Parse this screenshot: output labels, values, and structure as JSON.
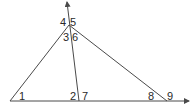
{
  "diagram": {
    "stroke_color": "#4a4a4a",
    "label_color": "#2a2a2a",
    "angle_labels": [
      {
        "id": "1",
        "text": "1",
        "x": 19,
        "y": 100
      },
      {
        "id": "2",
        "text": "2",
        "x": 70,
        "y": 100
      },
      {
        "id": "7",
        "text": "7",
        "x": 82,
        "y": 100
      },
      {
        "id": "3",
        "text": "3",
        "x": 63,
        "y": 41
      },
      {
        "id": "6",
        "text": "6",
        "x": 72,
        "y": 41
      },
      {
        "id": "4",
        "text": "4",
        "x": 60,
        "y": 26
      },
      {
        "id": "5",
        "text": "5",
        "x": 70,
        "y": 26
      },
      {
        "id": "8",
        "text": "8",
        "x": 148,
        "y": 100
      },
      {
        "id": "9",
        "text": "9",
        "x": 167,
        "y": 100
      }
    ]
  }
}
